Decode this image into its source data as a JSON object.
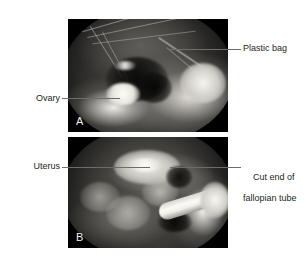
{
  "figure": {
    "type": "medical-photograph-figure",
    "background_color": "#ffffff",
    "text_color": "#231f20",
    "leader_line_color": "#6e6b69",
    "panels": [
      {
        "letter": "A",
        "modality": "laparoscopic photograph",
        "subject": "Ovary contained within a plastic retrieval bag",
        "frame_color": "#000000"
      },
      {
        "letter": "B",
        "modality": "laparoscopic photograph",
        "subject": "Uterus with cut end of fallopian tube and surgical instrument",
        "frame_color": "#000000"
      }
    ]
  },
  "labels": {
    "plastic_bag": "Plastic bag",
    "ovary": "Ovary",
    "uterus": "Uterus",
    "cut_end_line1": "Cut end of",
    "cut_end_line2": "fallopian tube"
  }
}
